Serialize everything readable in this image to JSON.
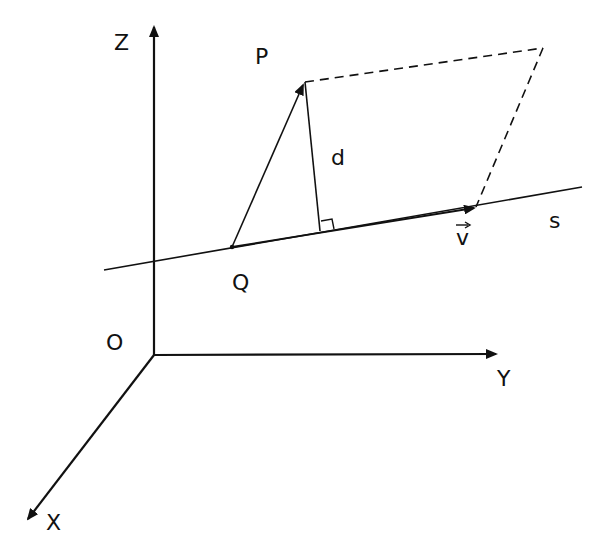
{
  "diagram": {
    "title": "",
    "colors": {
      "stroke": "#111111",
      "background": "#ffffff"
    },
    "axes": {
      "z_label": "Z",
      "y_label": "Y",
      "x_label": "X",
      "origin_label": "O"
    },
    "points": {
      "p_label": "P",
      "q_label": "Q"
    },
    "segments": {
      "distance_label": "d"
    },
    "line": {
      "name_label": "s",
      "direction_vector_label": "v"
    },
    "annotations": {
      "right_angle": "right-angle marker at foot of perpendicular",
      "parallelogram": "dashed parallelogram spanned by QP and v"
    }
  }
}
